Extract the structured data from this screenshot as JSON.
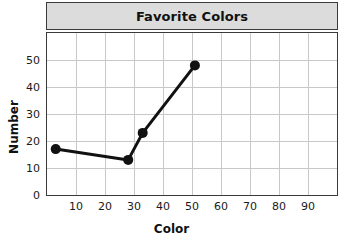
{
  "chart_data": {
    "type": "line",
    "title": "Favorite Colors",
    "xlabel": "Color",
    "ylabel": "Number",
    "x": [
      3,
      28,
      33,
      51
    ],
    "values": [
      17,
      13,
      23,
      48
    ],
    "points": [
      {
        "x": 3,
        "y": 17
      },
      {
        "x": 28,
        "y": 13
      },
      {
        "x": 33,
        "y": 23
      },
      {
        "x": 51,
        "y": 48
      }
    ],
    "xlim": [
      0,
      100
    ],
    "ylim": [
      0,
      60
    ],
    "xticks": [
      10,
      20,
      30,
      40,
      50,
      60,
      70,
      80,
      90
    ],
    "yticks": [
      0,
      10,
      20,
      30,
      40,
      50
    ],
    "xtick_labels": [
      "10",
      "20",
      "30",
      "40",
      "50",
      "60",
      "70",
      "80",
      "90"
    ],
    "ytick_labels": [
      "0",
      "10",
      "20",
      "30",
      "40",
      "50"
    ],
    "grid": true,
    "legend": false,
    "marker": "filled-circle",
    "series_color": "#111111",
    "grid_color": "#c8c8c8",
    "frame_color": "#3a3a3a",
    "title_bar_color": "#dcdcdc"
  }
}
